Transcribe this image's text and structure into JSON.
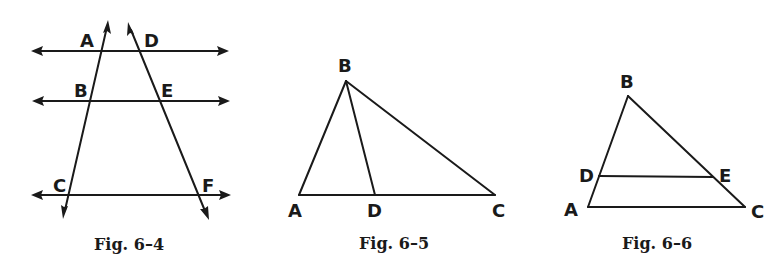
{
  "figures": [
    {
      "caption": "Fig. 6–4",
      "description": "Three parallel lines cut by two transversals",
      "labels": {
        "A": "A",
        "B": "B",
        "C": "C",
        "D": "D",
        "E": "E",
        "F": "F"
      }
    },
    {
      "caption": "Fig. 6–5",
      "description": "Triangle ABC with segment BD to base AC",
      "labels": {
        "A": "A",
        "B": "B",
        "C": "C",
        "D": "D"
      }
    },
    {
      "caption": "Fig. 6–6",
      "description": "Triangle ABC with segment DE parallel to AC",
      "labels": {
        "A": "A",
        "B": "B",
        "C": "C",
        "D": "D",
        "E": "E"
      }
    }
  ],
  "colors": {
    "ink": "#1a1a1a",
    "background": "#ffffff"
  }
}
